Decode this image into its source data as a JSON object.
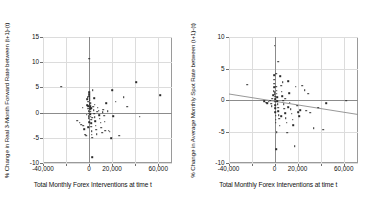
{
  "chart_data": [
    {
      "type": "scatter",
      "panel": "left",
      "title": "",
      "xlabel": "Total Monthly Forex Interventions at time t",
      "ylabel": "% Change in Real 3-Month Forward Rate between (t+1)-(t)",
      "xlim": [
        -40000,
        72000
      ],
      "ylim": [
        -10,
        15
      ],
      "xticks": [
        -40000,
        -20000,
        0,
        20000,
        40000,
        60000
      ],
      "xticklabels": [
        "-40,000",
        "",
        "0",
        "20,000",
        "",
        "60,000"
      ],
      "yticks": [
        -10,
        -5,
        0,
        5,
        10,
        15
      ],
      "yticklabels": [
        "-10",
        "-5",
        "0",
        "5",
        "10",
        "15"
      ],
      "grid": true,
      "legend": "none",
      "zero_line_y": 0,
      "zero_line_x": 0,
      "trendline": null,
      "points": [
        [
          -24000,
          5.1
        ],
        [
          -10500,
          -1.6
        ],
        [
          -8200,
          -2.0
        ],
        [
          -7000,
          -2.4
        ],
        [
          -5200,
          -2.6
        ],
        [
          -4000,
          -3.3
        ],
        [
          -3200,
          -4.4
        ],
        [
          -2600,
          -4.6
        ],
        [
          -2200,
          -0.4
        ],
        [
          -1800,
          1.5
        ],
        [
          -1500,
          2.6
        ],
        [
          -1200,
          3.0
        ],
        [
          -900,
          2.2
        ],
        [
          -700,
          1.3
        ],
        [
          -500,
          0.8
        ],
        [
          -400,
          0.3
        ],
        [
          -300,
          -0.2
        ],
        [
          -200,
          -0.7
        ],
        [
          -150,
          -1.1
        ],
        [
          -100,
          -1.9
        ],
        [
          0,
          10.7
        ],
        [
          100,
          4.0
        ],
        [
          200,
          3.6
        ],
        [
          300,
          3.2
        ],
        [
          400,
          2.9
        ],
        [
          500,
          2.5
        ],
        [
          600,
          2.0
        ],
        [
          700,
          1.7
        ],
        [
          800,
          1.3
        ],
        [
          900,
          0.9
        ],
        [
          1000,
          0.6
        ],
        [
          1100,
          0.2
        ],
        [
          1200,
          -0.3
        ],
        [
          1400,
          -0.8
        ],
        [
          1600,
          -1.4
        ],
        [
          1800,
          -2.1
        ],
        [
          2000,
          -2.8
        ],
        [
          2200,
          -3.7
        ],
        [
          2400,
          -4.4
        ],
        [
          2600,
          -5.0
        ],
        [
          2800,
          -8.8
        ],
        [
          3200,
          4.4
        ],
        [
          3600,
          1.2
        ],
        [
          4000,
          0.5
        ],
        [
          4400,
          -0.2
        ],
        [
          4800,
          -0.9
        ],
        [
          5200,
          -1.7
        ],
        [
          5600,
          -2.6
        ],
        [
          6000,
          -3.4
        ],
        [
          6500,
          -4.3
        ],
        [
          7000,
          0.2
        ],
        [
          7600,
          1.0
        ],
        [
          8200,
          0.4
        ],
        [
          8800,
          -0.5
        ],
        [
          9400,
          -1.2
        ],
        [
          10000,
          -2.0
        ],
        [
          10600,
          -3.0
        ],
        [
          11200,
          -4.0
        ],
        [
          11800,
          0.1
        ],
        [
          12400,
          0.6
        ],
        [
          13000,
          -0.6
        ],
        [
          13600,
          -1.8
        ],
        [
          14200,
          -3.6
        ],
        [
          15000,
          1.9
        ],
        [
          16000,
          0.3
        ],
        [
          17000,
          -3.6
        ],
        [
          18000,
          -3.8
        ],
        [
          19000,
          -5.1
        ],
        [
          20000,
          4.4
        ],
        [
          21000,
          -0.7
        ],
        [
          23000,
          2.2
        ],
        [
          26000,
          -4.6
        ],
        [
          30000,
          3.1
        ],
        [
          33000,
          1.2
        ],
        [
          41000,
          6.0
        ],
        [
          44000,
          -0.8
        ],
        [
          62000,
          3.4
        ],
        [
          -5600,
          1.0
        ],
        [
          1300,
          1.9
        ],
        [
          5000,
          1.6
        ],
        [
          2900,
          -1.0
        ],
        [
          -600,
          -2.9
        ],
        [
          1900,
          0.9
        ],
        [
          4200,
          2.8
        ]
      ]
    },
    {
      "type": "scatter",
      "panel": "right",
      "title": "",
      "xlabel": "Total Monthly Forex Interventions at time t",
      "ylabel": "% Change in Average Monthly Spot Rate between (t+1)-(t)",
      "xlim": [
        -40000,
        72000
      ],
      "ylim": [
        -10,
        10
      ],
      "xticks": [
        -40000,
        -20000,
        0,
        20000,
        40000,
        60000
      ],
      "xticklabels": [
        "-40,000",
        "",
        "0",
        "20,000",
        "",
        "60,000"
      ],
      "yticks": [
        -10,
        -5,
        0,
        5,
        10
      ],
      "yticklabels": [
        "-10",
        "-5",
        "0",
        "5",
        "10"
      ],
      "grid": true,
      "legend": "none",
      "zero_line_y": 0,
      "zero_line_x": 0,
      "trendline": {
        "x1": -40000,
        "y1": 0.95,
        "x2": 72000,
        "y2": -2.3
      },
      "points": [
        [
          -24000,
          2.4
        ],
        [
          -9000,
          -0.2
        ],
        [
          -7500,
          -0.4
        ],
        [
          -6200,
          -0.5
        ],
        [
          -5000,
          -0.3
        ],
        [
          -4000,
          -0.1
        ],
        [
          -3000,
          -0.6
        ],
        [
          -2400,
          -1.0
        ],
        [
          -1800,
          0.2
        ],
        [
          -1200,
          0.8
        ],
        [
          -800,
          1.4
        ],
        [
          -500,
          2.0
        ],
        [
          -300,
          2.6
        ],
        [
          -200,
          3.2
        ],
        [
          -100,
          3.9
        ],
        [
          0,
          8.6
        ],
        [
          100,
          1.2
        ],
        [
          200,
          0.9
        ],
        [
          300,
          0.5
        ],
        [
          400,
          0.1
        ],
        [
          500,
          -0.3
        ],
        [
          600,
          -0.8
        ],
        [
          700,
          -1.3
        ],
        [
          800,
          -1.9
        ],
        [
          900,
          -2.5
        ],
        [
          1000,
          -3.1
        ],
        [
          1100,
          -3.6
        ],
        [
          1300,
          -7.8
        ],
        [
          1500,
          2.1
        ],
        [
          1700,
          1.5
        ],
        [
          1900,
          1.0
        ],
        [
          2100,
          0.4
        ],
        [
          2300,
          -0.2
        ],
        [
          2600,
          -0.7
        ],
        [
          2900,
          -1.2
        ],
        [
          3200,
          -1.8
        ],
        [
          3600,
          -2.4
        ],
        [
          4000,
          -3.0
        ],
        [
          4400,
          -4.1
        ],
        [
          5000,
          3.8
        ],
        [
          5600,
          2.3
        ],
        [
          6200,
          1.3
        ],
        [
          6800,
          0.6
        ],
        [
          7400,
          -0.1
        ],
        [
          8000,
          -0.7
        ],
        [
          8600,
          -1.4
        ],
        [
          9200,
          -2.1
        ],
        [
          9800,
          -2.9
        ],
        [
          10400,
          -3.6
        ],
        [
          11000,
          -5.2
        ],
        [
          11800,
          3.0
        ],
        [
          12500,
          1.1
        ],
        [
          13200,
          -0.4
        ],
        [
          14000,
          -1.5
        ],
        [
          14800,
          -2.2
        ],
        [
          15600,
          -3.1
        ],
        [
          16400,
          -4.0
        ],
        [
          17500,
          -7.3
        ],
        [
          18500,
          2.1
        ],
        [
          19500,
          -0.9
        ],
        [
          20500,
          -1.9
        ],
        [
          21500,
          -2.6
        ],
        [
          22500,
          -1.6
        ],
        [
          24000,
          2.3
        ],
        [
          26000,
          1.6
        ],
        [
          27500,
          -1.7
        ],
        [
          29000,
          1.0
        ],
        [
          31000,
          -2.0
        ],
        [
          34000,
          -4.5
        ],
        [
          38000,
          -1.2
        ],
        [
          42000,
          -4.7
        ],
        [
          45000,
          -0.5
        ],
        [
          62000,
          -0.1
        ],
        [
          3000,
          6.1
        ],
        [
          1400,
          4.2
        ],
        [
          7000,
          2.8
        ],
        [
          12000,
          -1.1
        ],
        [
          2000,
          -5.1
        ],
        [
          9000,
          0.2
        ],
        [
          5800,
          -2.6
        ]
      ]
    }
  ]
}
